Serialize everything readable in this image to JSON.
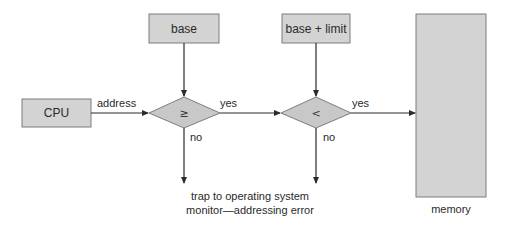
{
  "diagram": {
    "nodes": {
      "cpu": {
        "label": "CPU"
      },
      "base": {
        "label": "base"
      },
      "base_limit": {
        "label": "base + limit"
      },
      "compare_ge": {
        "label": "≥"
      },
      "compare_lt": {
        "label": "<"
      },
      "memory": {
        "label": "memory"
      }
    },
    "edges": {
      "address": {
        "label": "address"
      },
      "yes1": {
        "label": "yes"
      },
      "yes2": {
        "label": "yes"
      },
      "no1": {
        "label": "no"
      },
      "no2": {
        "label": "no"
      }
    },
    "trap": {
      "line1": "trap to operating system",
      "line2": "monitor—addressing error"
    },
    "colors": {
      "box_fill": "#d3d3d3",
      "box_stroke": "#7d7d7d",
      "line": "#2b2b2b",
      "text": "#2a2a2a"
    }
  }
}
